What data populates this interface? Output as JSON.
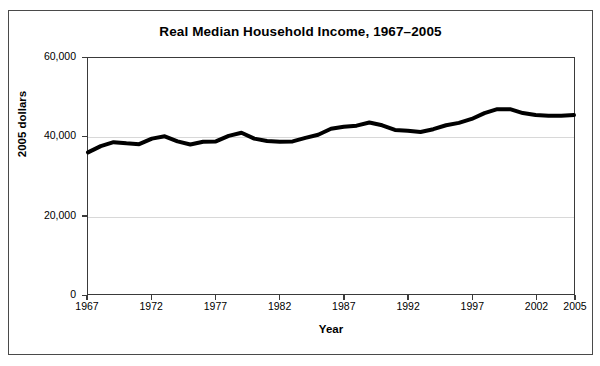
{
  "chart_data": {
    "type": "line",
    "title": "Real Median Household Income, 1967–2005",
    "xlabel": "Year",
    "ylabel": "2005 dollars",
    "xlim": [
      1967,
      2005
    ],
    "ylim": [
      0,
      60000
    ],
    "grid": true,
    "legend": false,
    "line_color": "#000000",
    "line_width": 4,
    "y_ticks": [
      {
        "value": 0,
        "label": "0"
      },
      {
        "value": 20000,
        "label": "20,000"
      },
      {
        "value": 40000,
        "label": "40,000"
      },
      {
        "value": 60000,
        "label": "60,000"
      }
    ],
    "x_ticks": [
      {
        "value": 1967,
        "label": "1967"
      },
      {
        "value": 1972,
        "label": "1972"
      },
      {
        "value": 1977,
        "label": "1977"
      },
      {
        "value": 1982,
        "label": "1982"
      },
      {
        "value": 1987,
        "label": "1987"
      },
      {
        "value": 1992,
        "label": "1992"
      },
      {
        "value": 1997,
        "label": "1997"
      },
      {
        "value": 2002,
        "label": "2002"
      },
      {
        "value": 2005,
        "label": "2005"
      }
    ],
    "x": [
      1967,
      1968,
      1969,
      1970,
      1971,
      1972,
      1973,
      1974,
      1975,
      1976,
      1977,
      1978,
      1979,
      1980,
      1981,
      1982,
      1983,
      1984,
      1985,
      1986,
      1987,
      1988,
      1989,
      1990,
      1991,
      1992,
      1993,
      1994,
      1995,
      1996,
      1997,
      1998,
      1999,
      2000,
      2001,
      2002,
      2003,
      2004,
      2005
    ],
    "series": [
      {
        "name": "Real median household income",
        "values": [
          36000,
          37600,
          38600,
          38300,
          38100,
          39500,
          40100,
          38800,
          38000,
          38700,
          38800,
          40200,
          41000,
          39500,
          38900,
          38700,
          38800,
          39700,
          40500,
          42000,
          42500,
          42800,
          43600,
          42900,
          41700,
          41500,
          41200,
          41900,
          42900,
          43500,
          44500,
          46000,
          47000,
          47000,
          46000,
          45500,
          45300,
          45300,
          45500
        ]
      }
    ]
  }
}
